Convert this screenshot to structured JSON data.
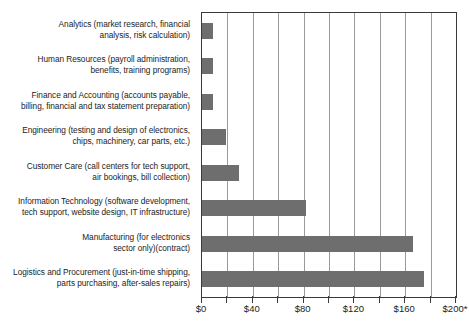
{
  "chart_data": {
    "type": "bar",
    "orientation": "horizontal",
    "title": "",
    "subtitle": "",
    "xlabel": "",
    "ylabel": "",
    "xlim": [
      0,
      200
    ],
    "grid": true,
    "gridline_step": 20,
    "legend": null,
    "tick_labels": [
      "$0",
      "$40",
      "$80",
      "$120",
      "$160",
      "$200*"
    ],
    "tick_values": [
      0,
      40,
      80,
      120,
      160,
      200
    ],
    "categories": [
      "Analytics (market research, financial\nanalysis, risk calculation)",
      "Human Resources (payroll administration,\nbenefits, training programs)",
      "Finance and Accounting (accounts payable,\nbilling, financial and tax statement preparation)",
      "Engineering (testing and design of electronics,\nchips, machinery, car parts, etc.)",
      "Customer Care (call centers for tech support,\nair bookings, bill collection)",
      "Information Technology (software development,\ntech support, website design, IT infrastructure)",
      "Manufacturing (for electronics\nsector only)(contract)",
      "Logistics and Procurement (just-in-time shipping,\nparts purchasing, after-sales repairs)"
    ],
    "values": [
      9,
      9,
      9,
      19,
      29,
      82,
      166,
      175
    ],
    "bar_color": "#6e6e6e",
    "axis_color": "#3a3a3a",
    "gridline_color": "#9a9a9a"
  },
  "footnote": {
    "text": ""
  }
}
